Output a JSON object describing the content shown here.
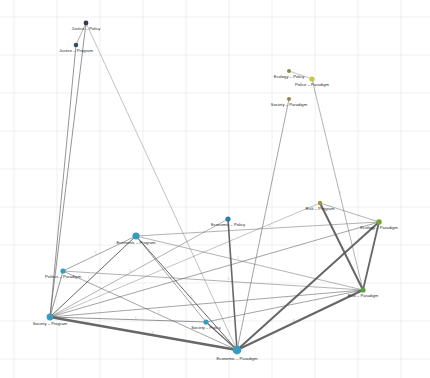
{
  "figure": {
    "type": "network-graph",
    "background_color": "#ffffff",
    "grid_color": "#e9ecef",
    "edge_color": "#5a5a5a",
    "label_color": "#2b2b2b",
    "width": 430,
    "height": 378
  },
  "chart_data": {
    "type": "scatter",
    "title": "",
    "xlabel": "",
    "ylabel": "",
    "grid": true,
    "legend": "none",
    "xlim": [
      0,
      430
    ],
    "ylim": [
      0,
      378
    ],
    "grid_x": [
      14,
      57,
      100,
      143,
      186,
      229,
      272,
      315,
      358,
      401
    ],
    "grid_y": [
      17,
      55,
      93,
      131,
      169,
      207,
      245,
      283,
      321,
      359
    ],
    "nodes": [
      {
        "id": "justice-policy",
        "label": "Justice – Policy",
        "x": 86,
        "y": 23,
        "r": 2.4,
        "color": "#2f3b57",
        "label_dx": 0,
        "label_dy": 6
      },
      {
        "id": "justice-program",
        "label": "Justice – Program",
        "x": 76,
        "y": 45,
        "r": 2.3,
        "color": "#2f4b6e",
        "label_dx": 0,
        "label_dy": 6
      },
      {
        "id": "ecology-policy",
        "label": "Ecology – Policy",
        "x": 289,
        "y": 71,
        "r": 2.0,
        "color": "#8d8a3e",
        "label_dx": 0,
        "label_dy": 6
      },
      {
        "id": "police-paradigm",
        "label": "Police – Paradigm",
        "x": 312,
        "y": 79,
        "r": 2.6,
        "color": "#c8c83c",
        "label_dx": 0,
        "label_dy": 6
      },
      {
        "id": "society-paradigm",
        "label": "Society – Paradigm",
        "x": 289,
        "y": 99,
        "r": 2.0,
        "color": "#8d8a3e",
        "label_dx": 0,
        "label_dy": 6
      },
      {
        "id": "risk-program",
        "label": "Risk – Program",
        "x": 320,
        "y": 203,
        "r": 2.2,
        "color": "#9a9a3a",
        "label_dx": 0,
        "label_dy": 6
      },
      {
        "id": "ecology-paradigm",
        "label": "Ecology – Paradigm",
        "x": 379,
        "y": 222,
        "r": 2.8,
        "color": "#7aa33a",
        "label_dx": 0,
        "label_dy": 6
      },
      {
        "id": "economic-policy",
        "label": "Economic – Policy",
        "x": 228,
        "y": 219,
        "r": 2.6,
        "color": "#2e7f9e",
        "label_dx": 0,
        "label_dy": 6
      },
      {
        "id": "economic-program",
        "label": "Economic – Program",
        "x": 136,
        "y": 236,
        "r": 3.6,
        "color": "#3a9bbf",
        "label_dx": 0,
        "label_dy": 7
      },
      {
        "id": "politics-paradigm",
        "label": "Politics – Paradigm",
        "x": 63,
        "y": 271,
        "r": 2.6,
        "color": "#3a9bbf",
        "label_dx": 0,
        "label_dy": 6
      },
      {
        "id": "risk-paradigm",
        "label": "Risk – Paradigm",
        "x": 363,
        "y": 290,
        "r": 2.6,
        "color": "#5f9e3a",
        "label_dx": 0,
        "label_dy": 6
      },
      {
        "id": "society-policy",
        "label": "Society – Policy",
        "x": 206,
        "y": 322,
        "r": 2.6,
        "color": "#3a9bbf",
        "label_dx": 0,
        "label_dy": 6
      },
      {
        "id": "society-program",
        "label": "Society – Program",
        "x": 50,
        "y": 317,
        "r": 3.4,
        "color": "#3a9bbf",
        "label_dx": 0,
        "label_dy": 7
      },
      {
        "id": "economic-paradigm",
        "label": "Economic – Paradigm",
        "x": 237,
        "y": 350,
        "r": 4.4,
        "color": "#3a9bbf",
        "label_dx": 0,
        "label_dy": 9
      }
    ],
    "edges": [
      {
        "source": "justice-policy",
        "target": "justice-program",
        "width": 0.5,
        "label": ""
      },
      {
        "source": "justice-policy",
        "target": "society-program",
        "width": 0.7,
        "label": "1"
      },
      {
        "source": "justice-program",
        "target": "society-program",
        "width": 0.7,
        "label": "1"
      },
      {
        "source": "justice-policy",
        "target": "economic-paradigm",
        "width": 0.4,
        "label": ""
      },
      {
        "source": "ecology-policy",
        "target": "police-paradigm",
        "width": 0.4,
        "label": ""
      },
      {
        "source": "police-paradigm",
        "target": "risk-paradigm",
        "width": 0.5,
        "label": "1"
      },
      {
        "source": "society-paradigm",
        "target": "economic-paradigm",
        "width": 0.6,
        "label": "1"
      },
      {
        "source": "risk-program",
        "target": "risk-paradigm",
        "width": 2.0,
        "label": "2"
      },
      {
        "source": "risk-program",
        "target": "ecology-paradigm",
        "width": 0.5,
        "label": ""
      },
      {
        "source": "ecology-paradigm",
        "target": "risk-paradigm",
        "width": 1.8,
        "label": "2"
      },
      {
        "source": "ecology-paradigm",
        "target": "economic-paradigm",
        "width": 2.0,
        "label": "2"
      },
      {
        "source": "risk-paradigm",
        "target": "economic-paradigm",
        "width": 2.2,
        "label": "3"
      },
      {
        "source": "risk-paradigm",
        "target": "society-program",
        "width": 0.6,
        "label": "1"
      },
      {
        "source": "risk-paradigm",
        "target": "economic-program",
        "width": 0.5,
        "label": "1"
      },
      {
        "source": "economic-policy",
        "target": "economic-paradigm",
        "width": 1.6,
        "label": "2"
      },
      {
        "source": "economic-policy",
        "target": "society-program",
        "width": 0.5,
        "label": "1"
      },
      {
        "source": "economic-program",
        "target": "society-program",
        "width": 1.0,
        "label": "1"
      },
      {
        "source": "economic-program",
        "target": "economic-paradigm",
        "width": 1.0,
        "label": "1"
      },
      {
        "source": "economic-program",
        "target": "politics-paradigm",
        "width": 0.6,
        "label": "1"
      },
      {
        "source": "economic-program",
        "target": "society-policy",
        "width": 0.6,
        "label": "1"
      },
      {
        "source": "economic-program",
        "target": "ecology-paradigm",
        "width": 0.5,
        "label": "1"
      },
      {
        "source": "politics-paradigm",
        "target": "society-program",
        "width": 0.7,
        "label": ""
      },
      {
        "source": "politics-paradigm",
        "target": "economic-paradigm",
        "width": 0.6,
        "label": "1"
      },
      {
        "source": "politics-paradigm",
        "target": "risk-paradigm",
        "width": 0.5,
        "label": "1"
      },
      {
        "source": "society-program",
        "target": "economic-paradigm",
        "width": 2.6,
        "label": "3"
      },
      {
        "source": "society-program",
        "target": "society-policy",
        "width": 0.7,
        "label": "1"
      },
      {
        "source": "society-program",
        "target": "ecology-paradigm",
        "width": 0.6,
        "label": "1"
      },
      {
        "source": "society-policy",
        "target": "economic-paradigm",
        "width": 1.1,
        "label": "1"
      },
      {
        "source": "society-policy",
        "target": "risk-paradigm",
        "width": 0.6,
        "label": "1"
      },
      {
        "source": "society-program",
        "target": "risk-program",
        "width": 0.4,
        "label": ""
      }
    ]
  }
}
